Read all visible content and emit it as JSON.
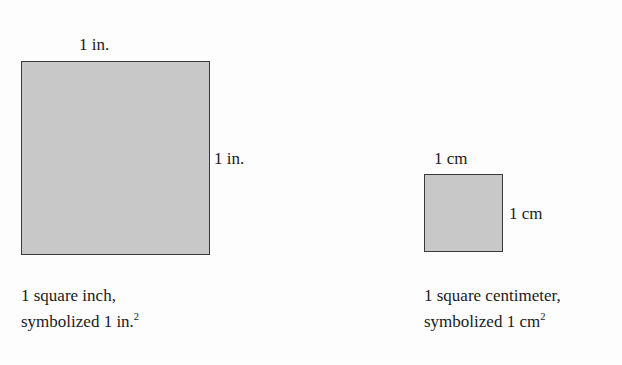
{
  "figure": {
    "background_color": "#fdfdfd",
    "shape_fill_color": "#c8c8c8",
    "shape_border_color": "#3a3a3a",
    "text_color": "#1a1a1a"
  },
  "square_inch": {
    "top_label": "1 in.",
    "right_label": "1 in.",
    "caption_line1": "1 square inch,",
    "caption_line2_prefix": "symbolized 1 in.",
    "caption_exponent": "2",
    "width_px": 189,
    "height_px": 194
  },
  "square_centimeter": {
    "top_label": "1 cm",
    "right_label": "1 cm",
    "caption_line1": "1 square centimeter,",
    "caption_line2_prefix": "symbolized 1 cm",
    "caption_exponent": "2",
    "width_px": 79,
    "height_px": 78
  }
}
